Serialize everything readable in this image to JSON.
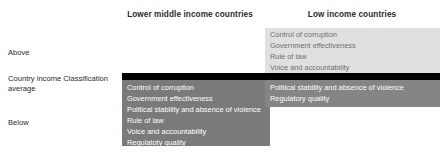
{
  "chart_data": {
    "type": "table",
    "title": "",
    "columns": [
      "Lower middle income countries",
      "Low income countries"
    ],
    "rows": [
      "Above",
      "Country income Classification average",
      "Below"
    ],
    "cells": [
      {
        "row": "Above",
        "column": "Lower middle income countries",
        "items": []
      },
      {
        "row": "Above",
        "column": "Low income countries",
        "items": [
          "Control of corruption",
          "Government effectiveness",
          "Rule of law",
          "Voice and accountability"
        ]
      },
      {
        "row": "Below",
        "column": "Lower middle income countries",
        "items": [
          "Control of corruption",
          "Government effectiveness",
          "Political stability and absence of violence",
          "Rule of law",
          "Voice and accountability",
          "Regulatoty quality"
        ]
      },
      {
        "row": "Below",
        "column": "Low income countries",
        "items": [
          "Political stability and absence of violence",
          "Regulatory quality"
        ]
      }
    ],
    "colors": {
      "above_block": "#e0e0e0",
      "average_bar": "#000000",
      "below_left_block": "#7a7a7a",
      "below_right_block": "#858585",
      "background": "#ffffff",
      "text_dark": "#2b2b2b",
      "text_light": "#ffffff"
    }
  },
  "headers": {
    "lower_middle_income": "Lower middle income countries",
    "low_income": "Low income countries"
  },
  "row_labels": {
    "above": "Above",
    "average": "Country income Classification average",
    "below": "Below"
  },
  "blocks": {
    "low_income_above": {
      "items": [
        "Control of corruption",
        "Government effectiveness",
        "Rule of law",
        "Voice and accountability"
      ]
    },
    "lower_middle_income_below": {
      "items": [
        "Control of corruption",
        "Government effectiveness",
        "Political stability and absence of violence",
        "Rule of law",
        "Voice and accountability",
        "Regulatoty quality"
      ]
    },
    "low_income_below": {
      "items": [
        "Political stability and absence of violence",
        "Regulatory quality"
      ]
    }
  }
}
